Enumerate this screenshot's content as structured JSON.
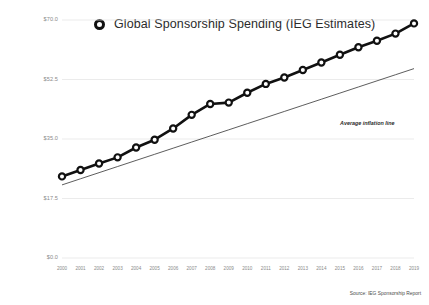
{
  "chart_data": {
    "type": "line",
    "title": "Global Sponsorship Spending (IEG Estimates)",
    "xlabel": "",
    "ylabel": "",
    "ylim": [
      0,
      70
    ],
    "yticks": [
      0,
      17.5,
      35,
      52.5,
      70
    ],
    "ytick_labels": [
      "$0.0",
      "$17.5",
      "$35.0",
      "$52.5",
      "$70.0"
    ],
    "grid": true,
    "legend_position": "top-center",
    "categories": [
      "2000",
      "2001",
      "2002",
      "2003",
      "2004",
      "2005",
      "2006",
      "2007",
      "2008",
      "2009",
      "2010",
      "2011",
      "2012",
      "2013",
      "2014",
      "2015",
      "2016",
      "2017",
      "2018",
      "2019"
    ],
    "series": [
      {
        "name": "Global Sponsorship Spending (IEG Estimates)",
        "marker": "open-circle",
        "color": "#111111",
        "values": [
          24.0,
          25.9,
          27.8,
          29.6,
          32.5,
          34.8,
          38.1,
          42.1,
          45.3,
          45.7,
          48.6,
          51.2,
          53.1,
          55.3,
          57.5,
          59.8,
          62.0,
          63.9,
          66.0,
          69.0
        ]
      },
      {
        "name": "Average inflation line",
        "marker": "none",
        "color": "#333333",
        "values": [
          21.5,
          23.3,
          25.1,
          26.9,
          28.7,
          30.5,
          32.3,
          34.1,
          35.9,
          37.7,
          39.5,
          41.3,
          43.1,
          44.9,
          46.7,
          48.5,
          50.3,
          52.1,
          53.9,
          55.7
        ]
      }
    ],
    "annotations": [
      {
        "text": "Average inflation line",
        "target": "inflation-trend"
      }
    ],
    "source": "Source: IEG Sponsorship Report"
  }
}
